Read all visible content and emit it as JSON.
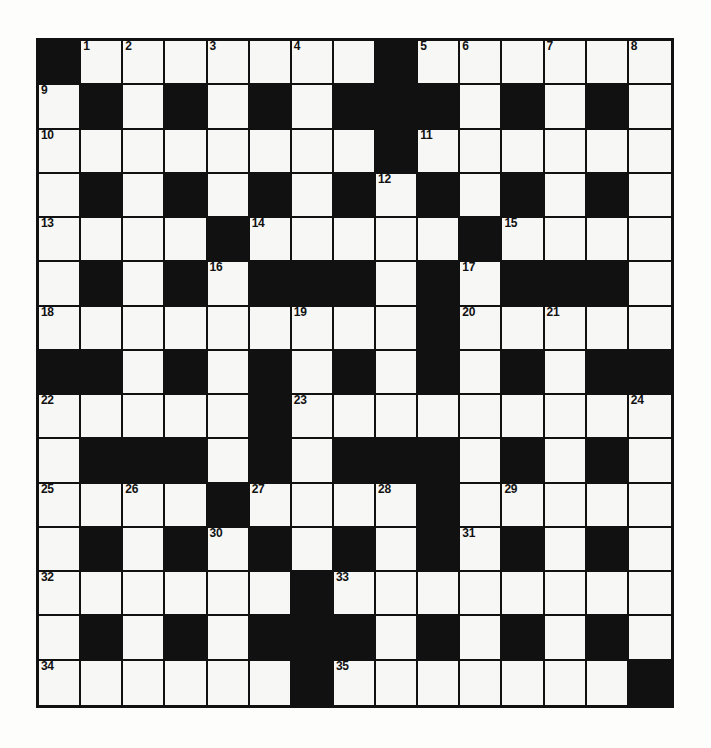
{
  "puzzle": {
    "title": "Crossword Grid",
    "size": {
      "rows": 15,
      "cols": 15
    },
    "colors": {
      "block": "#111111",
      "cell": "#f7f7f5",
      "border": "#111111",
      "page_background": "#fdfdfb",
      "number_text": "#111111"
    },
    "legend": {
      "block_symbol": "#",
      "open_symbol": "."
    },
    "grid": [
      "#.......#......",
      ".#.#.#.###.#.#.",
      "........#......",
      ".#.#.#.#.#.#.#.",
      "....#.....#....",
      ".#.#.###.#.###.",
      ".........#.....",
      "##.#.#.#.#.#.##",
      ".....#.........",
      ".###.#.###.#.#.",
      "....#....#.....",
      ".#.#.#.#.#.#.#.",
      "......#........",
      ".#.#.###.#.#.#.",
      "......#.......#"
    ],
    "numbers": [
      {
        "n": 1,
        "row": 0,
        "col": 1
      },
      {
        "n": 2,
        "row": 0,
        "col": 2
      },
      {
        "n": 3,
        "row": 0,
        "col": 4
      },
      {
        "n": 4,
        "row": 0,
        "col": 6
      },
      {
        "n": 5,
        "row": 0,
        "col": 9
      },
      {
        "n": 6,
        "row": 0,
        "col": 10
      },
      {
        "n": 7,
        "row": 0,
        "col": 12
      },
      {
        "n": 8,
        "row": 0,
        "col": 14
      },
      {
        "n": 9,
        "row": 1,
        "col": 0
      },
      {
        "n": 10,
        "row": 2,
        "col": 0
      },
      {
        "n": 11,
        "row": 2,
        "col": 9
      },
      {
        "n": 12,
        "row": 3,
        "col": 8
      },
      {
        "n": 13,
        "row": 4,
        "col": 0
      },
      {
        "n": 14,
        "row": 4,
        "col": 5
      },
      {
        "n": 15,
        "row": 4,
        "col": 11
      },
      {
        "n": 16,
        "row": 5,
        "col": 4
      },
      {
        "n": 17,
        "row": 5,
        "col": 10
      },
      {
        "n": 18,
        "row": 6,
        "col": 0
      },
      {
        "n": 19,
        "row": 6,
        "col": 6
      },
      {
        "n": 20,
        "row": 6,
        "col": 10
      },
      {
        "n": 21,
        "row": 6,
        "col": 12
      },
      {
        "n": 22,
        "row": 8,
        "col": 0
      },
      {
        "n": 23,
        "row": 8,
        "col": 6
      },
      {
        "n": 24,
        "row": 8,
        "col": 14
      },
      {
        "n": 25,
        "row": 10,
        "col": 0
      },
      {
        "n": 26,
        "row": 10,
        "col": 2
      },
      {
        "n": 27,
        "row": 10,
        "col": 5
      },
      {
        "n": 28,
        "row": 10,
        "col": 8
      },
      {
        "n": 29,
        "row": 10,
        "col": 11
      },
      {
        "n": 30,
        "row": 11,
        "col": 4
      },
      {
        "n": 31,
        "row": 11,
        "col": 10
      },
      {
        "n": 32,
        "row": 12,
        "col": 0
      },
      {
        "n": 33,
        "row": 12,
        "col": 7
      },
      {
        "n": 34,
        "row": 14,
        "col": 0
      },
      {
        "n": 35,
        "row": 14,
        "col": 7
      }
    ],
    "entries": []
  }
}
